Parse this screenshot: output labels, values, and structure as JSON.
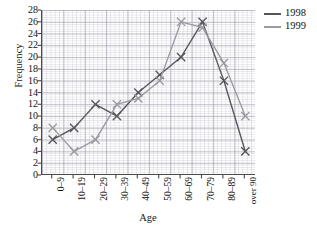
{
  "chart_data": {
    "type": "line",
    "title": "",
    "xlabel": "Age",
    "ylabel": "Frequency",
    "categories": [
      "0–9",
      "10–19",
      "20–29",
      "30–39",
      "40–49",
      "50–59",
      "60–69",
      "70–79",
      "80–89",
      "over 90"
    ],
    "ylim": [
      0,
      28
    ],
    "ytick_step": 2,
    "yticks": [
      0,
      2,
      4,
      6,
      8,
      10,
      12,
      14,
      16,
      18,
      20,
      22,
      24,
      26,
      28
    ],
    "grid": true,
    "legend_position": "right-top",
    "marker": "x",
    "series": [
      {
        "name": "1998",
        "color": "#55555b",
        "values": [
          6,
          8,
          12,
          10,
          14,
          17,
          20,
          26,
          16,
          4
        ]
      },
      {
        "name": "1999",
        "color": "#9a9aa2",
        "values": [
          8,
          4,
          6,
          12,
          13,
          16,
          26,
          25,
          19,
          10
        ]
      }
    ]
  }
}
